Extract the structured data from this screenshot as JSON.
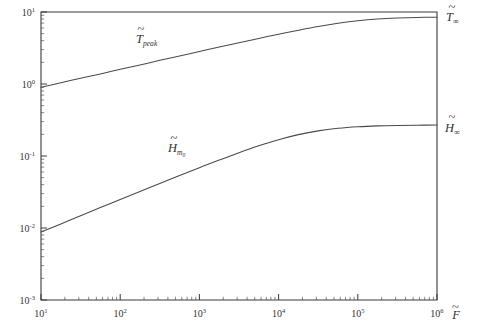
{
  "figure": {
    "background": "#ffffff",
    "frame_color": "#3a3a3a",
    "curve_color": "#4a4a4a"
  },
  "axes": {
    "x_title": "F",
    "x_title_accent": "~",
    "y_title": "",
    "x_ticklabels": [
      "10",
      "10",
      "10",
      "10",
      "10",
      "10"
    ],
    "x_tickexponents": [
      "1",
      "2",
      "3",
      "4",
      "5",
      "6"
    ],
    "y_ticklabels": [
      "10",
      "10",
      "10",
      "10",
      "10"
    ],
    "y_tickexponents": [
      "1",
      "0",
      "-1",
      "-2",
      "-3"
    ]
  },
  "annotations": {
    "curve1_label": "T",
    "curve1_accent": "~",
    "curve1_sub": "peak",
    "curve2_label": "H",
    "curve2_accent": "~",
    "curve2_sub": "m",
    "curve2_sub_sub": "0",
    "asymptote1_label": "T",
    "asymptote1_accent": "~",
    "asymptote1_sub": "∞",
    "asymptote2_label": "H",
    "asymptote2_accent": "~",
    "asymptote2_sub": "∞"
  },
  "chart_data": {
    "type": "line",
    "title": "",
    "xlabel": "F̃",
    "ylabel": "",
    "xscale": "log",
    "yscale": "log",
    "xlim": [
      10,
      1000000
    ],
    "ylim": [
      0.001,
      10
    ],
    "grid": false,
    "legend": "inline-labels",
    "xticks": [
      10,
      100,
      1000,
      10000,
      100000,
      1000000
    ],
    "yticks": [
      0.001,
      0.01,
      0.1,
      1,
      10
    ],
    "series": [
      {
        "name": "T̃_peak",
        "asymptote_label": "T̃∞",
        "asymptote_value": 8.5,
        "x": [
          10,
          17.8,
          31.6,
          56.2,
          100,
          178,
          316,
          562,
          1000,
          1780,
          3160,
          5620,
          10000,
          17800,
          31600,
          56200,
          100000,
          178000,
          316000,
          562000,
          1000000
        ],
        "y": [
          0.9,
          1.04,
          1.2,
          1.38,
          1.6,
          1.84,
          2.13,
          2.45,
          2.83,
          3.26,
          3.75,
          4.3,
          4.92,
          5.58,
          6.28,
          6.96,
          7.56,
          8.0,
          8.26,
          8.41,
          8.48
        ]
      },
      {
        "name": "H̃_m0",
        "asymptote_label": "H̃∞",
        "asymptote_value": 0.27,
        "x": [
          10,
          17.8,
          31.6,
          56.2,
          100,
          178,
          316,
          562,
          1000,
          1780,
          3160,
          5620,
          10000,
          17800,
          31600,
          56200,
          100000,
          178000,
          316000,
          562000,
          1000000
        ],
        "y": [
          0.0088,
          0.0114,
          0.0148,
          0.0192,
          0.0249,
          0.0322,
          0.0416,
          0.0537,
          0.0689,
          0.0879,
          0.1112,
          0.1386,
          0.1686,
          0.1981,
          0.2234,
          0.2422,
          0.2546,
          0.2621,
          0.2661,
          0.2681,
          0.269
        ]
      }
    ]
  }
}
